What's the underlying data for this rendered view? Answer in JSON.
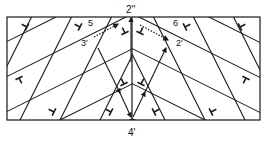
{
  "diagram": {
    "type": "grain-boundary-dislocation-lattice",
    "colors": {
      "line": "#1a1a1a",
      "background": "#ffffff"
    },
    "labels": {
      "top_center": "2''",
      "bottom_center": "4'",
      "left_upper_number": "5",
      "left_vector": "3'",
      "right_upper_number": "6",
      "right_vector": "2'"
    },
    "symbols": {
      "dislocation": "⊥",
      "count_left": 6,
      "count_right": 6
    }
  }
}
